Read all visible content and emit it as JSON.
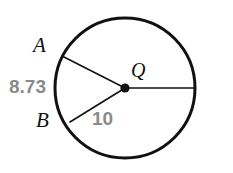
{
  "figure": {
    "type": "circle-with-radii",
    "background_color": "#ffffff",
    "stroke_color": "#111111",
    "measure_color": "#8a8a8a"
  },
  "circle": {
    "center_label": "Q",
    "center_x": 125,
    "center_y": 88,
    "radius": 70,
    "stroke_width": 3
  },
  "center_point": {
    "label": "Q",
    "dot_radius": 4.6
  },
  "points": [
    {
      "label": "A",
      "x": 62,
      "y": 56,
      "label_x": 33,
      "label_y": 35
    },
    {
      "label": "B",
      "x": 70,
      "y": 122,
      "label_x": 36,
      "label_y": 110
    }
  ],
  "radii": [
    {
      "name": "radius-QA",
      "from": "Q",
      "to": "A",
      "x1": 125,
      "y1": 88,
      "x2": 62,
      "y2": 56
    },
    {
      "name": "radius-QB",
      "from": "Q",
      "to": "B",
      "x1": 125,
      "y1": 88,
      "x2": 70,
      "y2": 122
    },
    {
      "name": "radius-QR",
      "from": "Q",
      "to": "right",
      "x1": 125,
      "y1": 88,
      "x2": 195,
      "y2": 88
    }
  ],
  "labels": {
    "point_a": "A",
    "point_b": "B",
    "center": "Q",
    "chord_length": "8.73",
    "radius_length": "10"
  }
}
